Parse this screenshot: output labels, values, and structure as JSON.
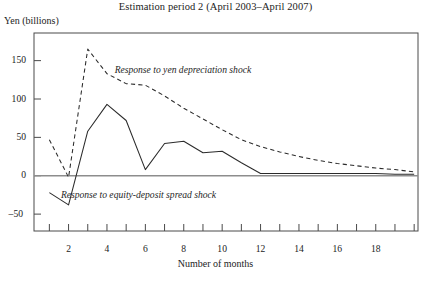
{
  "chart_data": {
    "type": "line",
    "title": "Estimation period 2 (April 2003–April 2007)",
    "xlabel": "Number of months",
    "ylabel": "Yen (billions)",
    "xlim": [
      0.2,
      20.2
    ],
    "ylim": [
      -72,
      186
    ],
    "grid": false,
    "legend_position": "inline-annotations",
    "zero_line": true,
    "x": [
      1,
      2,
      3,
      4,
      5,
      6,
      7,
      8,
      9,
      10,
      11,
      12,
      13,
      14,
      15,
      16,
      17,
      18,
      19,
      20
    ],
    "yticks": [
      -50,
      0,
      50,
      100,
      150
    ],
    "ytick_labels": [
      "–50",
      "0",
      "50",
      "100",
      "150"
    ],
    "xticks": [
      1,
      2,
      3,
      4,
      5,
      6,
      7,
      8,
      9,
      10,
      11,
      12,
      13,
      14,
      15,
      16,
      17,
      18,
      19,
      20
    ],
    "xtick_labels_shown": [
      2,
      4,
      6,
      8,
      10,
      12,
      14,
      16,
      18
    ],
    "series": [
      {
        "name": "Response to yen depreciation shock",
        "style": "dashed",
        "color": "#2b2b2b",
        "values": [
          47,
          -2,
          165,
          133,
          120,
          118,
          104,
          88,
          74,
          60,
          47,
          38,
          31,
          25,
          20,
          16,
          13,
          10,
          8,
          5
        ]
      },
      {
        "name": "Response to equity-deposit spread shock",
        "style": "solid",
        "color": "#2b2b2b",
        "values": [
          -22,
          -38,
          58,
          93,
          72,
          8,
          42,
          45,
          30,
          32,
          17,
          3,
          3,
          3,
          3,
          3,
          3,
          3,
          2,
          2
        ]
      }
    ],
    "annotations": [
      {
        "text": "Response to yen depreciation shock",
        "x": 4.4,
        "y": 138
      },
      {
        "text": "Response to equity-deposit spread shock",
        "x": 1.6,
        "y": -25
      }
    ]
  },
  "axis": {
    "ytick_labels": [
      "150",
      "100",
      "50",
      "0",
      "–50"
    ],
    "xtick_labels": [
      "2",
      "4",
      "6",
      "8",
      "10",
      "12",
      "14",
      "16",
      "18"
    ]
  }
}
